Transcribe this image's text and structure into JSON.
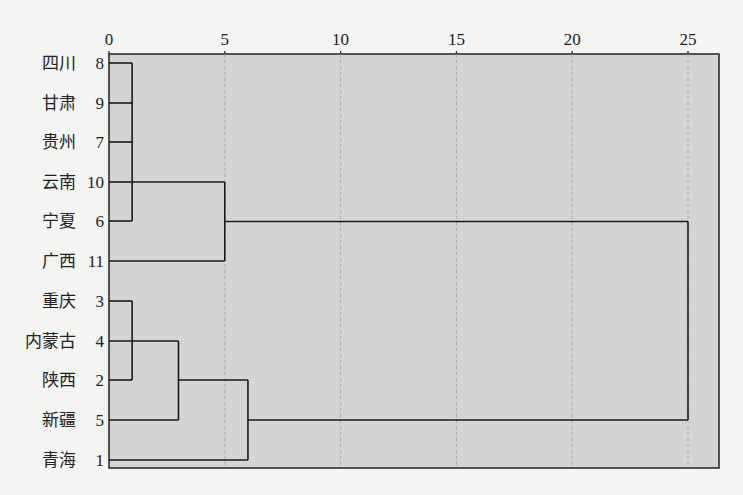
{
  "chart_data": {
    "type": "dendrogram",
    "title": "",
    "xlabel": "",
    "ylabel": "",
    "x_ticks": [
      0,
      5,
      10,
      15,
      20,
      25
    ],
    "xlim": [
      0,
      26.3
    ],
    "grid": {
      "vertical_dashed": true
    },
    "plot_background": "#d4d4d2",
    "line_color": "#1a1a1a",
    "leaves": [
      {
        "label": "四川",
        "id": 8
      },
      {
        "label": "甘肃",
        "id": 9
      },
      {
        "label": "贵州",
        "id": 7
      },
      {
        "label": "云南",
        "id": 10
      },
      {
        "label": "宁夏",
        "id": 6
      },
      {
        "label": "广西",
        "id": 11
      },
      {
        "label": "重庆",
        "id": 3
      },
      {
        "label": "内蒙古",
        "id": 4
      },
      {
        "label": "陕西",
        "id": 2
      },
      {
        "label": "新疆",
        "id": 5
      },
      {
        "label": "青海",
        "id": 1
      }
    ],
    "merges": [
      {
        "members": [
          8,
          9,
          7,
          10,
          6
        ],
        "distance": 1.0
      },
      {
        "members": [
          "[8,9,7,10,6]",
          11
        ],
        "distance": 5.0
      },
      {
        "members": [
          3,
          2
        ],
        "distance": 1.0
      },
      {
        "members": [
          4,
          5
        ],
        "distance": 3.0
      },
      {
        "members": [
          "[3,2]",
          "[4,5]",
          1
        ],
        "distance": 6.0
      },
      {
        "members": [
          "cluster A",
          "cluster B"
        ],
        "distance": 25.0
      }
    ]
  }
}
